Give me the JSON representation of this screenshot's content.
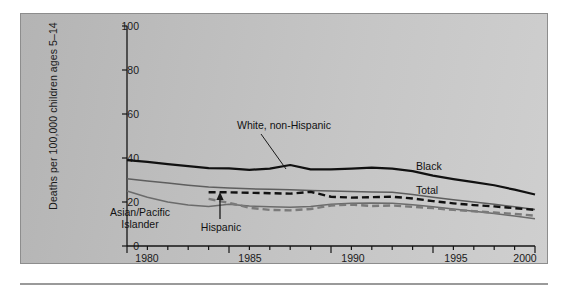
{
  "figure": {
    "background_color": "#c2c2c2",
    "ylabel": "Deaths per 100,000 children ages 5–14",
    "yticks": [
      "0",
      "20",
      "40",
      "60",
      "80",
      "100"
    ],
    "xticks": [
      "1980",
      "1985",
      "1990",
      "1995",
      "2000"
    ],
    "annotations": {
      "black": "Black",
      "total": "Total",
      "white_non_hispanic": "White, non-Hispanic",
      "hispanic": "Hispanic",
      "asian_pacific_islander_line1": "Asian/Pacific",
      "asian_pacific_islander_line2": "Islander"
    }
  },
  "chart_data": {
    "type": "line",
    "title": "",
    "xlabel": "",
    "ylabel": "Deaths per 100,000 children ages 5–14",
    "xlim": [
      1980,
      2000
    ],
    "ylim": [
      0,
      100
    ],
    "ytick_values": [
      0,
      20,
      40,
      60,
      80,
      100
    ],
    "xtick_values": [
      1980,
      1985,
      1990,
      1995,
      2000
    ],
    "minor_xticks": "every year",
    "grid": false,
    "legend": "inline annotations",
    "colors": {
      "black_series": "#111111",
      "total_series": "#5e5e5e",
      "white_non_hispanic_series": "#6b6b6b",
      "hispanic_series": "#7a7a7a",
      "asian_pacific_islander_series": "#111111"
    },
    "series": [
      {
        "name": "Black",
        "style": "solid",
        "color": "#111111",
        "x": [
          1980,
          1981,
          1982,
          1983,
          1984,
          1985,
          1986,
          1987,
          1988,
          1989,
          1990,
          1991,
          1992,
          1993,
          1994,
          1995,
          1996,
          1997,
          1998,
          1999,
          2000
        ],
        "values": [
          39.0,
          38.2,
          37.2,
          36.3,
          35.4,
          35.3,
          34.6,
          35.2,
          36.8,
          34.8,
          34.8,
          35.2,
          35.6,
          35.2,
          34.0,
          32.0,
          30.4,
          29.0,
          27.6,
          25.6,
          23.4
        ]
      },
      {
        "name": "Total",
        "style": "solid",
        "color": "#5e5e5e",
        "x": [
          1980,
          1981,
          1982,
          1983,
          1984,
          1985,
          1986,
          1987,
          1988,
          1989,
          1990,
          1991,
          1992,
          1993,
          1994,
          1995,
          1996,
          1997,
          1998,
          1999,
          2000
        ],
        "values": [
          30.6,
          29.6,
          28.6,
          27.6,
          26.8,
          26.4,
          26.0,
          25.8,
          25.6,
          25.2,
          25.0,
          24.8,
          24.6,
          24.4,
          23.4,
          22.2,
          21.0,
          20.0,
          19.0,
          17.8,
          16.6
        ]
      },
      {
        "name": "Asian/Pacific Islander",
        "style": "dashed",
        "color": "#111111",
        "x": [
          1984,
          1985,
          1986,
          1987,
          1988,
          1989,
          1990,
          1991,
          1992,
          1993,
          1994,
          1995,
          1996,
          1997,
          1998,
          1999,
          2000
        ],
        "values": [
          24.4,
          24.4,
          24.2,
          24.0,
          23.8,
          24.6,
          22.4,
          22.0,
          22.2,
          22.4,
          21.6,
          20.4,
          19.4,
          18.6,
          18.0,
          17.2,
          16.4
        ]
      },
      {
        "name": "White, non-Hispanic",
        "style": "solid",
        "color": "#6b6b6b",
        "x": [
          1980,
          1981,
          1982,
          1983,
          1984,
          1985,
          1986,
          1987,
          1988,
          1989,
          1990,
          1991,
          1992,
          1993,
          1994,
          1995,
          1996,
          1997,
          1998,
          1999,
          2000
        ],
        "values": [
          25.0,
          22.2,
          20.0,
          18.6,
          18.0,
          19.0,
          18.2,
          17.8,
          17.6,
          18.0,
          19.0,
          19.4,
          19.6,
          19.4,
          18.8,
          17.8,
          16.8,
          15.8,
          14.8,
          13.6,
          12.4
        ]
      },
      {
        "name": "Hispanic",
        "style": "dashed",
        "color": "#7a7a7a",
        "x": [
          1984,
          1985,
          1986,
          1987,
          1988,
          1989,
          1990,
          1991,
          1992,
          1993,
          1994,
          1995,
          1996,
          1997,
          1998,
          1999,
          2000
        ],
        "values": [
          21.4,
          19.6,
          17.4,
          16.4,
          16.2,
          16.8,
          18.4,
          18.8,
          18.2,
          18.4,
          17.8,
          17.2,
          16.4,
          15.8,
          15.2,
          14.6,
          13.8
        ]
      }
    ]
  }
}
